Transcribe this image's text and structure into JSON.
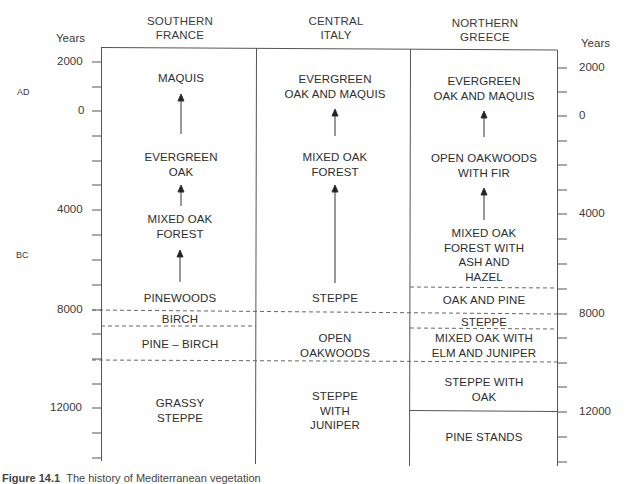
{
  "figure": {
    "type": "vegetation-history-chart",
    "axis_title": "Years",
    "era_labels": {
      "ad": "AD",
      "bc": "BC"
    },
    "axis_ticks": [
      {
        "label": "2000",
        "year": 2000
      },
      {
        "label": "0",
        "year": 0
      },
      {
        "label": "4000",
        "year": -4000
      },
      {
        "label": "8000",
        "year": -8000
      },
      {
        "label": "12000",
        "year": -12000
      }
    ],
    "columns": [
      {
        "heading_line1": "SOUTHERN",
        "heading_line2": "FRANCE",
        "zones": [
          {
            "lines": [
              "MAQUIS"
            ]
          },
          {
            "lines": [
              "EVERGREEN",
              "OAK"
            ]
          },
          {
            "lines": [
              "MIXED OAK",
              "FOREST"
            ]
          },
          {
            "lines": [
              "PINEWOODS"
            ]
          },
          {
            "lines": [
              "BIRCH"
            ]
          },
          {
            "lines": [
              "PINE – BIRCH"
            ]
          },
          {
            "lines": [
              "GRASSY",
              "STEPPE"
            ]
          }
        ]
      },
      {
        "heading_line1": "CENTRAL",
        "heading_line2": "ITALY",
        "zones": [
          {
            "lines": [
              "EVERGREEN",
              "OAK AND MAQUIS"
            ]
          },
          {
            "lines": [
              "MIXED OAK",
              "FOREST"
            ]
          },
          {
            "lines": [
              "STEPPE"
            ]
          },
          {
            "lines": [
              "OPEN",
              "OAKWOODS"
            ]
          },
          {
            "lines": [
              "STEPPE",
              "WITH",
              "JUNIPER"
            ]
          }
        ]
      },
      {
        "heading_line1": "NORTHERN",
        "heading_line2": "GREECE",
        "zones": [
          {
            "lines": [
              "EVERGREEN",
              "OAK AND MAQUIS"
            ]
          },
          {
            "lines": [
              "OPEN OAKWOODS",
              "WITH FIR"
            ]
          },
          {
            "lines": [
              "MIXED OAK",
              "FOREST WITH",
              "ASH AND",
              "HAZEL"
            ]
          },
          {
            "lines": [
              "OAK AND PINE"
            ]
          },
          {
            "lines": [
              "STEPPE"
            ]
          },
          {
            "lines": [
              "MIXED OAK WITH",
              "ELM AND JUNIPER"
            ]
          },
          {
            "lines": [
              "STEPPE WITH",
              "OAK"
            ]
          },
          {
            "lines": [
              "PINE STANDS"
            ]
          }
        ]
      }
    ],
    "caption": {
      "label": "Figure 14.1",
      "text": "The history of Mediterranean vegetation"
    }
  }
}
